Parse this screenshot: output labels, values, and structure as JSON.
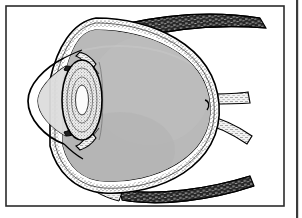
{
  "figure": {
    "kind": "anatomical-line-drawing",
    "style": "black and white engraving with stipple shading",
    "orientation": "cornea at left, optic nerve at right",
    "title_text": "",
    "caption_text": "",
    "labels": [],
    "colors": {
      "page_background": "#ffffff",
      "frame_border": "#2b2b2b",
      "edge_artifact_line": "#3a3a3a",
      "ink": "#000000",
      "vitreous_fill": "#b9b9b9",
      "vitreous_fill_shade": "#aeaeae",
      "anterior_chamber_fill": "#dcdcdc",
      "cornea_fill": "#f2f2f2",
      "lens_fill": "#e8e8e8",
      "lens_core_fill": "#fbfbfb",
      "sclera_fill": "#ffffff",
      "choroid_stipple": "#4a4a4a",
      "muscle_fill": "#2e2e2e",
      "optic_nerve_fill": "#f0f0f0"
    },
    "frame": {
      "x": 6,
      "y": 6,
      "width": 278,
      "height": 200,
      "stroke_width": 1.6
    },
    "edge_artifact": {
      "x": 296,
      "y": 0,
      "width": 2.2,
      "height": 218
    },
    "parts": [
      {
        "id": "globe",
        "name": "eyeball globe (sclera outline)"
      },
      {
        "id": "vitreous-body",
        "name": "vitreous body"
      },
      {
        "id": "cornea",
        "name": "cornea"
      },
      {
        "id": "anterior-chamber",
        "name": "anterior chamber"
      },
      {
        "id": "lens",
        "name": "crystalline lens"
      },
      {
        "id": "lens-nucleus",
        "name": "lens nucleus"
      },
      {
        "id": "iris-upper",
        "name": "iris (superior)"
      },
      {
        "id": "iris-lower",
        "name": "iris (inferior)"
      },
      {
        "id": "ciliary-body-upper",
        "name": "ciliary body (superior)"
      },
      {
        "id": "ciliary-body-lower",
        "name": "ciliary body (inferior)"
      },
      {
        "id": "sclera-band",
        "name": "sclera layer band"
      },
      {
        "id": "choroid-band",
        "name": "choroid layer band (stippled)"
      },
      {
        "id": "retina-band",
        "name": "retina layer band"
      },
      {
        "id": "optic-nerve-upper",
        "name": "optic nerve upper branch"
      },
      {
        "id": "optic-nerve-lower",
        "name": "optic nerve lower branch"
      },
      {
        "id": "optic-disc",
        "name": "optic disc"
      },
      {
        "id": "superior-rectus",
        "name": "superior rectus muscle"
      },
      {
        "id": "inferior-rectus",
        "name": "inferior rectus muscle"
      },
      {
        "id": "tendon-upper",
        "name": "superior muscle tendon insertion"
      },
      {
        "id": "tendon-lower",
        "name": "inferior muscle tendon insertion"
      }
    ]
  }
}
